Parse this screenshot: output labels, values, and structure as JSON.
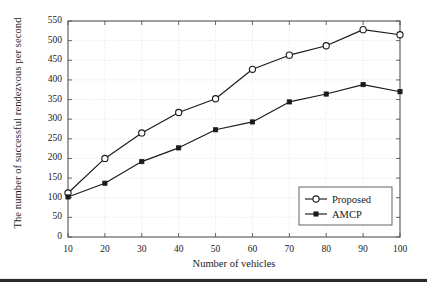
{
  "chart_data": {
    "type": "line",
    "title": "",
    "xlabel": "Number of vehicles",
    "ylabel": "The number of successful rendezvous per second",
    "x": [
      10,
      20,
      30,
      40,
      50,
      60,
      70,
      80,
      90,
      100
    ],
    "xlim": [
      10,
      100
    ],
    "ylim": [
      0,
      550
    ],
    "xticks": [
      "10",
      "20",
      "30",
      "40",
      "50",
      "60",
      "70",
      "80",
      "90",
      "100"
    ],
    "yticks": [
      "0",
      "50",
      "100",
      "150",
      "200",
      "250",
      "300",
      "350",
      "400",
      "450",
      "500",
      "550"
    ],
    "grid": true,
    "legend_position": "lower right",
    "series": [
      {
        "name": "Proposed",
        "marker": "open-circle",
        "color": "#1a1a1a",
        "values": [
          112,
          200,
          265,
          317,
          352,
          427,
          463,
          487,
          528,
          515
        ]
      },
      {
        "name": "AMCP",
        "marker": "filled-square",
        "color": "#1a1a1a",
        "values": [
          102,
          137,
          192,
          227,
          273,
          293,
          344,
          364,
          388,
          370
        ]
      }
    ]
  },
  "legend": {
    "entries": [
      {
        "label": "Proposed"
      },
      {
        "label": "AMCP"
      }
    ]
  },
  "colors": {
    "line": "#1a1a1a",
    "grid": "#d9d9d9",
    "frame": "#555555",
    "background": "#ffffff",
    "footer_rule": "#2b2b2b"
  }
}
